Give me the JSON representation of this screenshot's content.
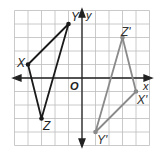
{
  "diagram": {
    "type": "coordinate-plane-transformation",
    "grid": {
      "xmin": -5,
      "xmax": 5,
      "ymin": -5,
      "ymax": 5,
      "step": 1
    },
    "axes": {
      "x_label": "x",
      "y_label": "y",
      "origin_label": "O"
    },
    "colors": {
      "grid": "#bdbdbd",
      "axes": "#222222",
      "original": "#1a1a1a",
      "image": "#8a8a8a"
    },
    "original_triangle": {
      "name": "XYZ",
      "vertices": [
        {
          "label": "X",
          "x": -4,
          "y": 1
        },
        {
          "label": "Y",
          "x": -1,
          "y": 4
        },
        {
          "label": "Z",
          "x": -3,
          "y": -3
        }
      ]
    },
    "image_triangle": {
      "name": "X'Y'Z'",
      "vertices": [
        {
          "label": "X'",
          "x": 4,
          "y": -1
        },
        {
          "label": "Y'",
          "x": 1,
          "y": -4
        },
        {
          "label": "Z'",
          "x": 3,
          "y": 3
        }
      ]
    },
    "labels": {
      "X": "X",
      "Y": "Y",
      "Z": "Z",
      "Xp": "X'",
      "Yp": "Y'",
      "Zp": "Z'"
    }
  }
}
